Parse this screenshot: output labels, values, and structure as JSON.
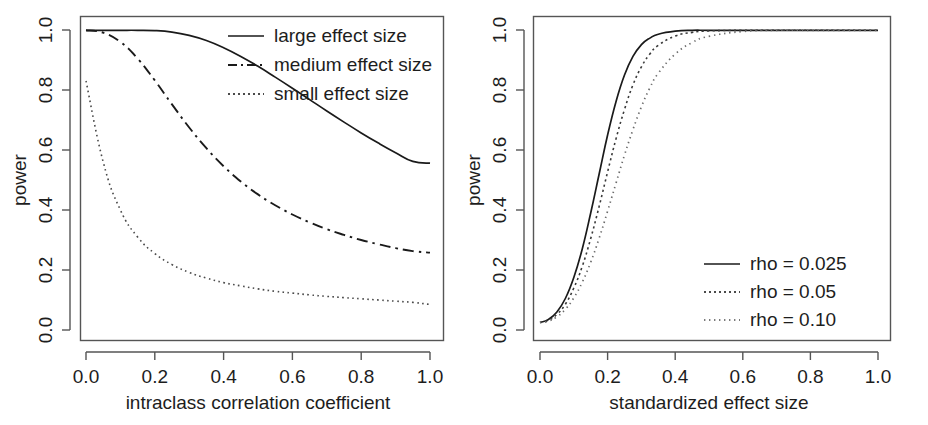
{
  "figure": {
    "background": "#ffffff",
    "foreground": "#1a1a1a",
    "panels": 2
  },
  "chart_data": [
    {
      "type": "line",
      "panel": "left",
      "title": "",
      "xlabel": "intraclass correlation coefficient",
      "ylabel": "power",
      "xlim": [
        0.0,
        1.0
      ],
      "ylim": [
        0.0,
        1.0
      ],
      "xticks": [
        "0.0",
        "0.2",
        "0.4",
        "0.6",
        "0.8",
        "1.0"
      ],
      "yticks": [
        "0.0",
        "0.2",
        "0.4",
        "0.6",
        "0.8",
        "1.0"
      ],
      "grid": false,
      "legend_position": "top-right",
      "x": [
        0.0,
        0.05,
        0.1,
        0.15,
        0.2,
        0.25,
        0.3,
        0.35,
        0.4,
        0.45,
        0.5,
        0.55,
        0.6,
        0.65,
        0.7,
        0.75,
        0.8,
        0.85,
        0.9,
        0.95,
        1.0
      ],
      "series": [
        {
          "name": "large effect size",
          "style": "solid",
          "values": [
            0.999,
            0.999,
            0.999,
            0.999,
            0.998,
            0.993,
            0.982,
            0.965,
            0.941,
            0.912,
            0.879,
            0.843,
            0.806,
            0.768,
            0.73,
            0.693,
            0.657,
            0.623,
            0.591,
            0.562,
            0.556
          ]
        },
        {
          "name": "medium effect size",
          "style": "dashed",
          "values": [
            0.999,
            0.991,
            0.96,
            0.905,
            0.832,
            0.752,
            0.675,
            0.606,
            0.546,
            0.495,
            0.452,
            0.416,
            0.385,
            0.359,
            0.336,
            0.317,
            0.3,
            0.286,
            0.273,
            0.263,
            0.258
          ]
        },
        {
          "name": "small effect size",
          "style": "dotted",
          "values": [
            0.83,
            0.56,
            0.4,
            0.31,
            0.255,
            0.218,
            0.192,
            0.173,
            0.158,
            0.147,
            0.137,
            0.129,
            0.123,
            0.117,
            0.112,
            0.108,
            0.104,
            0.1,
            0.096,
            0.092,
            0.085
          ]
        }
      ]
    },
    {
      "type": "line",
      "panel": "right",
      "title": "",
      "xlabel": "standardized effect size",
      "ylabel": "power",
      "xlim": [
        0.0,
        1.0
      ],
      "ylim": [
        0.0,
        1.0
      ],
      "xticks": [
        "0.0",
        "0.2",
        "0.4",
        "0.6",
        "0.8",
        "1.0"
      ],
      "yticks": [
        "0.0",
        "0.2",
        "0.4",
        "0.6",
        "0.8",
        "1.0"
      ],
      "grid": false,
      "legend_position": "bottom-right",
      "x": [
        0.0,
        0.025,
        0.05,
        0.075,
        0.1,
        0.125,
        0.15,
        0.175,
        0.2,
        0.225,
        0.25,
        0.275,
        0.3,
        0.325,
        0.35,
        0.4,
        0.45,
        0.5,
        0.6,
        0.7,
        0.8,
        0.9,
        1.0
      ],
      "series": [
        {
          "name": "rho = 0.025",
          "style": "solid",
          "values": [
            0.025,
            0.035,
            0.06,
            0.105,
            0.175,
            0.27,
            0.39,
            0.52,
            0.65,
            0.762,
            0.85,
            0.912,
            0.951,
            0.973,
            0.986,
            0.996,
            0.999,
            0.999,
            0.999,
            0.999,
            0.999,
            0.999,
            0.999
          ]
        },
        {
          "name": "rho = 0.05",
          "style": "dotted",
          "values": [
            0.025,
            0.032,
            0.052,
            0.086,
            0.14,
            0.212,
            0.305,
            0.412,
            0.527,
            0.638,
            0.735,
            0.817,
            0.877,
            0.92,
            0.949,
            0.98,
            0.992,
            0.997,
            0.999,
            0.999,
            0.999,
            0.999,
            0.999
          ]
        },
        {
          "name": "rho = 0.10",
          "style": "dotted3",
          "values": [
            0.025,
            0.03,
            0.044,
            0.069,
            0.107,
            0.159,
            0.226,
            0.306,
            0.396,
            0.49,
            0.583,
            0.668,
            0.744,
            0.807,
            0.856,
            0.92,
            0.958,
            0.979,
            0.995,
            0.999,
            0.999,
            0.999,
            0.999
          ]
        }
      ]
    }
  ],
  "left_panel": {
    "axis": {
      "x_title": "intraclass correlation coefficient",
      "y_title": "power",
      "x_ticks": [
        "0.0",
        "0.2",
        "0.4",
        "0.6",
        "0.8",
        "1.0"
      ],
      "y_ticks": [
        "0.0",
        "0.2",
        "0.4",
        "0.6",
        "0.8",
        "1.0"
      ]
    },
    "legend": {
      "items": [
        {
          "label": "large effect size",
          "style": "solid"
        },
        {
          "label": "medium effect size",
          "style": "dashed"
        },
        {
          "label": "small effect size",
          "style": "dotted"
        }
      ]
    }
  },
  "right_panel": {
    "axis": {
      "x_title": "standardized effect size",
      "y_title": "power",
      "x_ticks": [
        "0.0",
        "0.2",
        "0.4",
        "0.6",
        "0.8",
        "1.0"
      ],
      "y_ticks": [
        "0.0",
        "0.2",
        "0.4",
        "0.6",
        "0.8",
        "1.0"
      ]
    },
    "legend": {
      "items": [
        {
          "label": "rho = 0.025",
          "style": "solid"
        },
        {
          "label": "rho = 0.05",
          "style": "dotted"
        },
        {
          "label": "rho = 0.10",
          "style": "dotted3"
        }
      ]
    }
  }
}
